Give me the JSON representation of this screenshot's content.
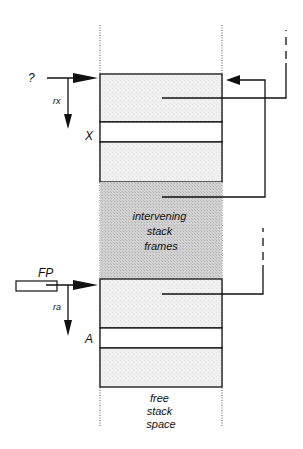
{
  "diagram": {
    "type": "stack-frame-layout",
    "left_labels": {
      "top_pointer": "?",
      "top_register": "rx",
      "top_slot": "X",
      "frame_pointer": "FP",
      "bottom_register": "ra",
      "bottom_slot": "A"
    },
    "regions": {
      "intervening": [
        "intervening",
        "stack",
        "frames"
      ],
      "free": [
        "free",
        "stack",
        "space"
      ]
    },
    "colors": {
      "line": "#111111",
      "frame_fill": "#efefef",
      "slot_fill": "#ffffff",
      "intervening_fill": "#c8c8c8",
      "dotted": "#555555"
    }
  }
}
